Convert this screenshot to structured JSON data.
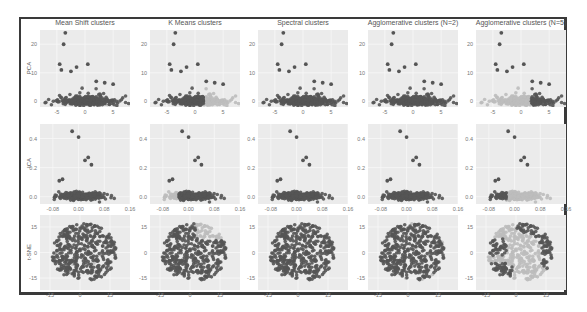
{
  "figure": {
    "columns": [
      {
        "title": "Mean Shift clusters"
      },
      {
        "title": "K Means clusters"
      },
      {
        "title": "Spectral clusters"
      },
      {
        "title": "Agglomerative clusters (N=2)"
      },
      {
        "title": "Agglomerative clusters (N=5)"
      }
    ],
    "rows": [
      {
        "ylabel": "PCA",
        "xticks": [
          "-5",
          "0",
          "5"
        ],
        "yticks": [
          "20",
          "10",
          "0"
        ]
      },
      {
        "ylabel": "ICA",
        "xticks": [
          "-0.08",
          "0.00",
          "0.08",
          "0.16"
        ],
        "yticks": [
          "0.4",
          "0.2",
          "0.0"
        ]
      },
      {
        "ylabel": "t-SNE",
        "xticks": [
          "-15",
          "0",
          "15"
        ],
        "yticks": [
          "15",
          "0",
          "-15"
        ]
      }
    ],
    "colors": {
      "panel_bg": "#ebebeb",
      "grid": "#f7f7f7",
      "dark_point": "#555555",
      "light_point": "#bdbdbd",
      "frame": "#3a3a3a"
    }
  },
  "chart_data": {
    "type": "scatter",
    "layout": "3x5 facet grid",
    "title": "",
    "column_titles": [
      "Mean Shift clusters",
      "K Means clusters",
      "Spectral clusters",
      "Agglomerative clusters (N=2)",
      "Agglomerative clusters (N=5)"
    ],
    "row_labels": [
      "PCA",
      "ICA",
      "t-SNE"
    ],
    "axes": [
      {
        "row": "PCA",
        "xlim": [
          -8,
          8
        ],
        "ylim": [
          -2,
          25
        ],
        "xticks": [
          -5,
          0,
          5
        ],
        "yticks": [
          0,
          10,
          20
        ]
      },
      {
        "row": "ICA",
        "xlim": [
          -0.12,
          0.16
        ],
        "ylim": [
          -0.05,
          0.5
        ],
        "xticks": [
          -0.08,
          0.0,
          0.08,
          0.16
        ],
        "yticks": [
          0.0,
          0.2,
          0.4
        ]
      },
      {
        "row": "t-SNE",
        "xlim": [
          -20,
          25
        ],
        "ylim": [
          -22,
          22
        ],
        "xticks": [
          -15,
          0,
          15
        ],
        "yticks": [
          -15,
          0,
          15
        ]
      }
    ],
    "outliers_pca": [
      [
        -3.5,
        24
      ],
      [
        -3.8,
        20
      ],
      [
        -4.5,
        13
      ],
      [
        -4.2,
        11
      ],
      [
        -2.5,
        10.5
      ],
      [
        -1.5,
        12
      ],
      [
        0.5,
        13
      ],
      [
        2,
        7
      ],
      [
        3.5,
        6.5
      ],
      [
        5,
        6
      ]
    ],
    "outliers_ica": [
      [
        -0.02,
        0.45
      ],
      [
        0.0,
        0.41
      ],
      [
        0.02,
        0.25
      ],
      [
        0.04,
        0.22
      ],
      [
        0.03,
        0.27
      ],
      [
        -0.05,
        0.12
      ],
      [
        -0.06,
        0.11
      ]
    ],
    "cluster_notes": [
      "Mean Shift: nearly all points in one dark cluster, few light points",
      "K Means: dark cluster on left/center, light cluster on right (PCA) / left (ICA)",
      "Spectral: nearly all points one dark cluster",
      "Agglomerative N=2: mostly dark, few light",
      "Agglomerative N=5: mostly light background points with dark subclusters at right/left edges"
    ],
    "grid": true,
    "legend": "none"
  }
}
